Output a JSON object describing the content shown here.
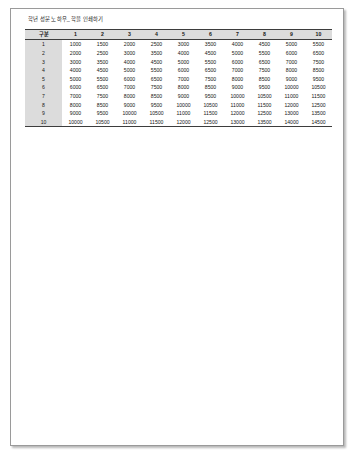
{
  "document": {
    "title": "학년 성문 노하우_ 학을 인쇄하기",
    "page_background": "#ffffff",
    "page_border_color": "#9a9a9a"
  },
  "table": {
    "corner_header": "구분",
    "column_headers": [
      "1",
      "2",
      "3",
      "4",
      "5",
      "6",
      "7",
      "8",
      "9",
      "10"
    ],
    "row_labels": [
      "1",
      "2",
      "3",
      "4",
      "5",
      "6",
      "7",
      "8",
      "9",
      "10"
    ],
    "header_background": "#dcdcdc",
    "row_label_background": "#dcdcdc",
    "rule_color": "#3d3d3d",
    "rows": [
      [
        "1000",
        "1500",
        "2000",
        "2500",
        "3000",
        "3500",
        "4000",
        "4500",
        "5000",
        "5500"
      ],
      [
        "2000",
        "2500",
        "3000",
        "3500",
        "4000",
        "4500",
        "5000",
        "5500",
        "6000",
        "6500"
      ],
      [
        "3000",
        "3500",
        "4000",
        "4500",
        "5000",
        "5500",
        "6000",
        "6500",
        "7000",
        "7500"
      ],
      [
        "4000",
        "4500",
        "5000",
        "5500",
        "6000",
        "6500",
        "7000",
        "7500",
        "8000",
        "8500"
      ],
      [
        "5000",
        "5500",
        "6000",
        "6500",
        "7000",
        "7500",
        "8000",
        "8500",
        "9000",
        "9500"
      ],
      [
        "6000",
        "6500",
        "7000",
        "7500",
        "8000",
        "8500",
        "9000",
        "9500",
        "10000",
        "10500"
      ],
      [
        "7000",
        "7500",
        "8000",
        "8500",
        "9000",
        "9500",
        "10000",
        "10500",
        "11000",
        "11500"
      ],
      [
        "8000",
        "8500",
        "9000",
        "9500",
        "10000",
        "10500",
        "11000",
        "11500",
        "12000",
        "12500"
      ],
      [
        "9000",
        "9500",
        "10000",
        "10500",
        "11000",
        "11500",
        "12000",
        "12500",
        "13000",
        "13500"
      ],
      [
        "10000",
        "10500",
        "11000",
        "11500",
        "12000",
        "12500",
        "13000",
        "13500",
        "14000",
        "14500"
      ]
    ]
  }
}
